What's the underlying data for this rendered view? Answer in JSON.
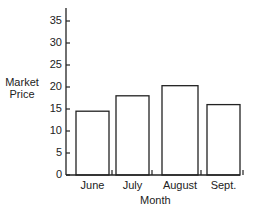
{
  "chart_data": {
    "type": "bar",
    "title": "",
    "xlabel": "Month",
    "ylabel": "Market Price",
    "ylabel_lines": [
      "Market",
      "Price"
    ],
    "categories": [
      "June",
      "July",
      "August",
      "Sept."
    ],
    "values": [
      14.5,
      18,
      20.3,
      16
    ],
    "ylim": [
      0,
      37
    ],
    "yticks": [
      0,
      5,
      10,
      15,
      20,
      25,
      30,
      35
    ],
    "grid": false,
    "legend": null
  }
}
